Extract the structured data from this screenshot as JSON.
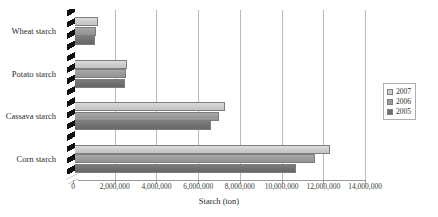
{
  "chart_data": {
    "type": "bar",
    "orientation": "horizontal",
    "title": "",
    "xlabel": "Starch (ton)",
    "ylabel": "",
    "categories": [
      "Wheat starch",
      "Potato starch",
      "Cassava starch",
      "Corn starch"
    ],
    "series": [
      {
        "name": "2007",
        "color": "#cdcdcd",
        "values": [
          1200000,
          2600000,
          7300000,
          12300000
        ]
      },
      {
        "name": "2006",
        "color": "#9b9b9b",
        "values": [
          1100000,
          2550000,
          7000000,
          11600000
        ]
      },
      {
        "name": "2005",
        "color": "#6f6f6f",
        "values": [
          1050000,
          2500000,
          6600000,
          10700000
        ]
      }
    ],
    "xlim": [
      0,
      14000000
    ],
    "xticks": [
      0,
      2000000,
      4000000,
      6000000,
      8000000,
      10000000,
      12000000,
      14000000
    ],
    "xtick_labels": [
      "0",
      "2,000,000",
      "4,000,000",
      "6,000,000",
      "8,000,000",
      "10,000,000",
      "12,000,000",
      "14,000,000"
    ],
    "grid": true,
    "grid_axis": "x",
    "legend_position": "right",
    "axis_break": true
  },
  "legend": {
    "entries": [
      {
        "label": "2007"
      },
      {
        "label": "2006"
      },
      {
        "label": "2005"
      }
    ]
  }
}
